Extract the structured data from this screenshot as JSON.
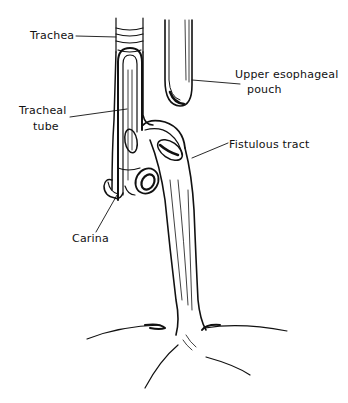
{
  "figure": {
    "type": "anatomical line drawing",
    "labels": [
      {
        "id": "trachea",
        "text": "Trachea"
      },
      {
        "id": "tracheal_tube_line1",
        "text": "Tracheal"
      },
      {
        "id": "tracheal_tube_line2",
        "text": "tube"
      },
      {
        "id": "upper_pouch_line1",
        "text": "Upper esophageal"
      },
      {
        "id": "upper_pouch_line2",
        "text": "pouch"
      },
      {
        "id": "fistulous_tract",
        "text": "Fistulous tract"
      },
      {
        "id": "carina",
        "text": "Carina"
      }
    ]
  }
}
